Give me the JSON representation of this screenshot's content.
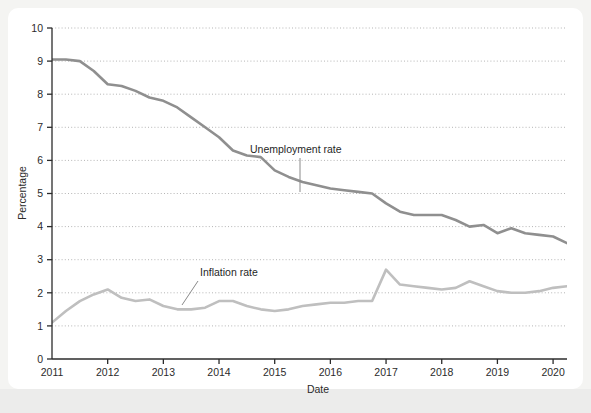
{
  "chart_data": {
    "type": "line",
    "title": "",
    "subtitle": "",
    "xlabel": "Date",
    "ylabel": "Percentage",
    "xlim": [
      2011.0,
      2020.25
    ],
    "ylim": [
      0,
      10
    ],
    "ytick_labels": [
      "0",
      "1",
      "2",
      "3",
      "4",
      "5",
      "6",
      "7",
      "8",
      "9",
      "10"
    ],
    "ytick_values": [
      0,
      1,
      2,
      3,
      4,
      5,
      6,
      7,
      8,
      9,
      10
    ],
    "xtick_labels": [
      "2011",
      "2012",
      "2013",
      "2014",
      "2015",
      "2016",
      "2017",
      "2018",
      "2019",
      "2020"
    ],
    "xtick_values": [
      2011,
      2012,
      2013,
      2014,
      2015,
      2016,
      2017,
      2018,
      2019,
      2020
    ],
    "grid": "horizontal-dotted",
    "legend_position": "inline-annotations",
    "series": [
      {
        "name": "Unemployment rate",
        "color": "#8f8f8f",
        "annotation_label": "Unemployment rate",
        "x": [
          2011.0,
          2011.25,
          2011.5,
          2011.75,
          2012.0,
          2012.25,
          2012.5,
          2012.75,
          2013.0,
          2013.25,
          2013.5,
          2013.75,
          2014.0,
          2014.25,
          2014.5,
          2014.75,
          2015.0,
          2015.25,
          2015.5,
          2015.75,
          2016.0,
          2016.25,
          2016.5,
          2016.75,
          2017.0,
          2017.25,
          2017.5,
          2017.75,
          2018.0,
          2018.25,
          2018.5,
          2018.75,
          2019.0,
          2019.25,
          2019.5,
          2019.75,
          2020.0,
          2020.25
        ],
        "values": [
          9.05,
          9.05,
          9.0,
          8.7,
          8.3,
          8.25,
          8.1,
          7.9,
          7.8,
          7.6,
          7.3,
          7.0,
          6.7,
          6.3,
          6.15,
          6.1,
          5.7,
          5.5,
          5.35,
          5.25,
          5.15,
          5.1,
          5.05,
          5.0,
          4.7,
          4.45,
          4.35,
          4.35,
          4.35,
          4.2,
          4.0,
          4.05,
          3.8,
          3.95,
          3.8,
          3.75,
          3.7,
          3.5
        ]
      },
      {
        "name": "Inflation rate",
        "color": "#bfbfbf",
        "annotation_label": "Inflation rate",
        "x": [
          2011.0,
          2011.25,
          2011.5,
          2011.75,
          2012.0,
          2012.25,
          2012.5,
          2012.75,
          2013.0,
          2013.25,
          2013.5,
          2013.75,
          2014.0,
          2014.25,
          2014.5,
          2014.75,
          2015.0,
          2015.25,
          2015.5,
          2015.75,
          2016.0,
          2016.25,
          2016.5,
          2016.75,
          2017.0,
          2017.25,
          2017.5,
          2017.75,
          2018.0,
          2018.25,
          2018.5,
          2018.75,
          2019.0,
          2019.25,
          2019.5,
          2019.75,
          2020.0,
          2020.25
        ],
        "values": [
          1.1,
          1.45,
          1.75,
          1.95,
          2.1,
          1.85,
          1.75,
          1.8,
          1.6,
          1.5,
          1.5,
          1.55,
          1.75,
          1.75,
          1.6,
          1.5,
          1.45,
          1.5,
          1.6,
          1.65,
          1.7,
          1.7,
          1.75,
          1.75,
          2.7,
          2.25,
          2.2,
          2.15,
          2.1,
          2.15,
          2.35,
          2.2,
          2.05,
          2.0,
          2.0,
          2.05,
          2.15,
          2.2
        ]
      }
    ],
    "annotations": [
      {
        "name": "unemployment-rate-annotation",
        "text": "Unemployment rate",
        "text_x_px": 250,
        "text_y_px": 153,
        "leader_from_px": [
          300,
          158
        ],
        "leader_to_px": [
          300,
          192
        ]
      },
      {
        "name": "inflation-rate-annotation",
        "text": "Inflation rate",
        "text_x_px": 200,
        "text_y_px": 276,
        "leader_from_px": [
          198,
          281
        ],
        "leader_to_px": [
          182,
          305
        ]
      }
    ]
  },
  "plot": {
    "axis_color": "#2b2b2b",
    "grid_color": "#b5b5b5",
    "background": "#ffffff",
    "page_background": "#f4f4f2"
  }
}
